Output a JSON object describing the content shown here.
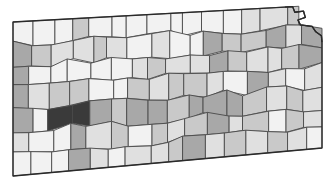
{
  "figure": {
    "kind": "choropleth-map",
    "region": "Kansas",
    "subdivision_unit": "county",
    "background_color": "#ffffff",
    "border_color": "#4a4a4a",
    "outline_color": "#2a2a2a",
    "has_title": false,
    "has_legend": false,
    "has_axes": false,
    "has_labels": false,
    "rotation_degrees": -2.5
  },
  "chart_data": {
    "type": "heatmap",
    "title": "",
    "subtitle": "",
    "xlabel": "",
    "ylabel": "",
    "legend_position": "none",
    "grid": false,
    "palette_name": "sequential-gray-5",
    "palette": [
      "#f2f2f2",
      "#e0e0e0",
      "#c9c9c9",
      "#a8a8a8",
      "#8d8d8d",
      "#3a3a3a"
    ],
    "class_labels": [
      "lowest",
      "low",
      "medium-low",
      "medium",
      "high",
      "highest"
    ],
    "shape_grid": {
      "rows": 7,
      "max_columns": 16,
      "note": "counties arranged in quasi-regular rows west to east"
    },
    "rows": [
      {
        "row": 1,
        "values": [
          1,
          1,
          1,
          3,
          1,
          1,
          1,
          1,
          1,
          1,
          1,
          1,
          2,
          2,
          3,
          1
        ]
      },
      {
        "row": 2,
        "values": [
          4,
          3,
          2,
          2,
          3,
          2,
          1,
          2,
          1,
          1,
          4,
          3,
          3,
          4,
          2,
          4
        ]
      },
      {
        "row": 3,
        "values": [
          4,
          1,
          1,
          1,
          1,
          1,
          2,
          3,
          2,
          2,
          4,
          3,
          2,
          2,
          3,
          4
        ]
      },
      {
        "row": 4,
        "values": [
          4,
          2,
          3,
          3,
          1,
          1,
          3,
          2,
          3,
          3,
          2,
          1,
          4,
          2,
          1,
          2
        ]
      },
      {
        "row": 5,
        "values": [
          4,
          1,
          6,
          6,
          4,
          3,
          4,
          4,
          3,
          4,
          4,
          4,
          3,
          2,
          3,
          2
        ]
      },
      {
        "row": 6,
        "values": [
          2,
          1,
          1,
          4,
          2,
          3,
          1,
          3,
          2,
          3,
          4,
          2,
          3,
          1,
          3,
          2
        ]
      },
      {
        "row": 7,
        "values": [
          1,
          1,
          1,
          4,
          2,
          1,
          2,
          2,
          3,
          4,
          2,
          3,
          2,
          3,
          2,
          1
        ]
      }
    ],
    "value_counts": {
      "1": 34,
      "2": 30,
      "3": 26,
      "4": 20,
      "6": 2
    }
  }
}
